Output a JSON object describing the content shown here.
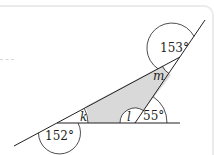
{
  "diagram": {
    "type": "geometry-angles",
    "labels": {
      "angle_bottom_left": "152°",
      "angle_k": "k",
      "angle_l": "l",
      "angle_right_base": "55°",
      "angle_m": "m",
      "angle_top": "153°"
    },
    "colors": {
      "line": "#231f20",
      "shade": "#d9d9d9",
      "frame": "#ebebeb"
    }
  }
}
